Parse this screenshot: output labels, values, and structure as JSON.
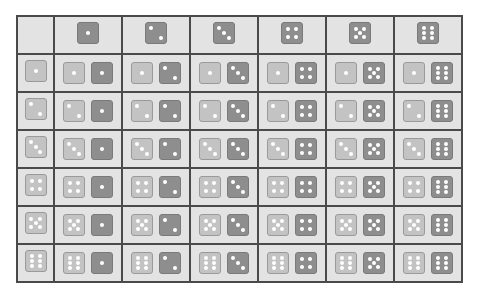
{
  "table": {
    "description": "Dice outcome grid: light die (row) x dark die (column)",
    "column_values": [
      1,
      2,
      3,
      4,
      5,
      6
    ],
    "row_values": [
      1,
      2,
      3,
      4,
      5,
      6
    ],
    "column_header_die": "dark",
    "row_header_die": "light",
    "cell_layout": [
      "light die = row value",
      "dark die = column value"
    ]
  },
  "colors": {
    "cell_background": "#e3e3e3",
    "grid_line": "#4a4a4a",
    "light_die": "#c3c3c3",
    "dark_die": "#8e8e8e",
    "pip": "#ffffff"
  }
}
